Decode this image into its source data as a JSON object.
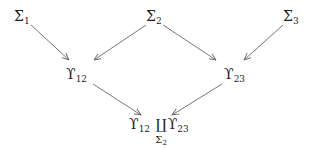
{
  "nodes": {
    "sigma1": {
      "base": "Σ",
      "sub": "1"
    },
    "sigma2": {
      "base": "Σ",
      "sub": "2"
    },
    "sigma3": {
      "base": "Σ",
      "sub": "3"
    },
    "upsilon12": {
      "base": "ϒ",
      "sub": "12"
    },
    "upsilon23": {
      "base": "ϒ",
      "sub": "23"
    },
    "pushout": {
      "left_base": "ϒ",
      "left_sub": "12",
      "coproduct_symbol": "∐",
      "under_base": "Σ",
      "under_sub": "2",
      "right_base": "ϒ",
      "right_sub": "23"
    }
  },
  "edges": [
    {
      "from": "sigma1",
      "to": "upsilon12"
    },
    {
      "from": "sigma2",
      "to": "upsilon12"
    },
    {
      "from": "sigma2",
      "to": "upsilon23"
    },
    {
      "from": "sigma3",
      "to": "upsilon23"
    },
    {
      "from": "upsilon12",
      "to": "pushout"
    },
    {
      "from": "upsilon23",
      "to": "pushout"
    }
  ],
  "colors": {
    "arrow": "#666666",
    "text": "#222222"
  }
}
